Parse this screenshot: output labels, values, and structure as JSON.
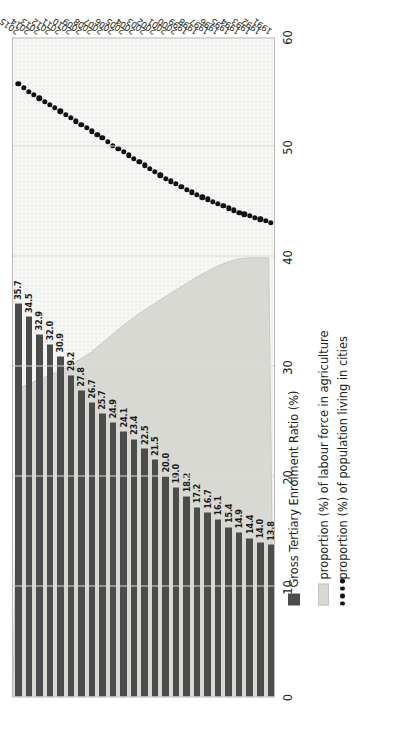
{
  "chart_data": {
    "type": "bar",
    "title": "",
    "xlabel": "",
    "ylabel": "",
    "ylim": [
      0,
      60
    ],
    "grid": true,
    "legend_position": "bottom",
    "orientation": "rotated-90-ccw",
    "categories": [
      "1991",
      "1992",
      "1993",
      "1994",
      "1995",
      "1996",
      "1997",
      "1998",
      "1999",
      "2000",
      "2001",
      "2002",
      "2003",
      "2004",
      "2005",
      "2006",
      "2007",
      "2008",
      "2009",
      "2010",
      "2011",
      "2012",
      "2013",
      "2014",
      "2015"
    ],
    "yticks": [
      "0",
      "10",
      "20",
      "30",
      "40",
      "50",
      "60"
    ],
    "series": [
      {
        "name": "Gross Tertiary Enrolment Ratio (%)",
        "type": "bar",
        "color": "#4c4c4c",
        "values": [
          13.8,
          14.0,
          14.4,
          14.9,
          15.4,
          16.1,
          16.7,
          17.2,
          18.2,
          19.0,
          20.0,
          21.5,
          22.5,
          23.4,
          24.1,
          24.9,
          25.7,
          26.7,
          27.8,
          29.2,
          30.9,
          32.0,
          32.9,
          34.5,
          35.7
        ],
        "labels": [
          "13.8",
          "14.0",
          "14.4",
          "14.9",
          "15.4",
          "16.1",
          "16.7",
          "17.2",
          "18.2",
          "19.0",
          "20.0",
          "21.5",
          "22.5",
          "23.4",
          "24.1",
          "24.9",
          "25.7",
          "26.7",
          "27.8",
          "29.2",
          "30.9",
          "32.0",
          "32.9",
          "34.5",
          "35.7"
        ]
      },
      {
        "name": "proportion (%) of labour force in agriculture",
        "type": "area",
        "color": "#d9d9d4",
        "values": [
          40.0,
          40.0,
          40.0,
          39.9,
          39.6,
          39.2,
          38.7,
          38.2,
          37.6,
          37.0,
          36.4,
          35.8,
          35.2,
          34.5,
          33.8,
          33.0,
          32.2,
          31.4,
          30.8,
          30.2,
          29.7,
          29.3,
          28.9,
          28.5,
          28.1
        ]
      },
      {
        "name": "proportion (%) of population living in cities",
        "type": "line-dotted",
        "color": "#111111",
        "values": [
          43.1,
          43.4,
          43.7,
          44.0,
          44.4,
          44.8,
          45.2,
          45.6,
          46.1,
          46.6,
          47.1,
          47.7,
          48.3,
          48.9,
          49.5,
          50.1,
          50.8,
          51.4,
          52.0,
          52.6,
          53.2,
          53.8,
          54.4,
          55.0,
          55.7
        ]
      }
    ]
  },
  "legend": {
    "items": [
      {
        "key": "area-swatch",
        "label": "proportion (%) of labour force in agriculture"
      },
      {
        "key": "dots-swatch",
        "label": "proportion (%) of population living in cities"
      },
      {
        "key": "bar-swatch",
        "label": "Gross Tertiary Enrolment Ratio (%)"
      }
    ]
  }
}
